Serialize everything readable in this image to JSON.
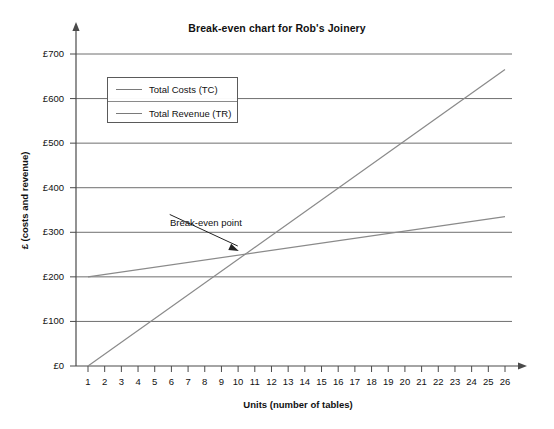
{
  "chart_data": {
    "type": "line",
    "title": "Break-even chart for Rob's Joinery",
    "xlabel": "Units (number of tables)",
    "ylabel": "£ (costs and revenue)",
    "xlim": [
      1,
      26
    ],
    "ylim": [
      0,
      700
    ],
    "grid": "horizontal",
    "legend_position": "upper-left-inside",
    "x_tick_labels": [
      "1",
      "2",
      "3",
      "4",
      "5",
      "6",
      "7",
      "8",
      "9",
      "10",
      "11",
      "12",
      "13",
      "14",
      "15",
      "16",
      "17",
      "18",
      "19",
      "20",
      "21",
      "22",
      "23",
      "24",
      "25",
      "26"
    ],
    "y_tick_labels": [
      "£0",
      "£100",
      "£200",
      "£300",
      "£400",
      "£500",
      "£600",
      "£700"
    ],
    "y_tick_values": [
      0,
      100,
      200,
      300,
      400,
      500,
      600,
      700
    ],
    "series": [
      {
        "name": "Total Costs (TC)",
        "color": "#8a8a8a",
        "points": [
          [
            1,
            200
          ],
          [
            26,
            335
          ]
        ]
      },
      {
        "name": "Total Revenue (TR)",
        "color": "#8a8a8a",
        "points": [
          [
            1,
            0
          ],
          [
            26,
            665
          ]
        ]
      }
    ],
    "annotations": [
      {
        "label": "Break-even point",
        "x": 10.1,
        "y": 249,
        "text_x": 5.9,
        "text_y": 340
      }
    ]
  },
  "legend": {
    "items": [
      {
        "label": "Total Costs (TC)"
      },
      {
        "label": "Total Revenue (TR)"
      }
    ]
  }
}
